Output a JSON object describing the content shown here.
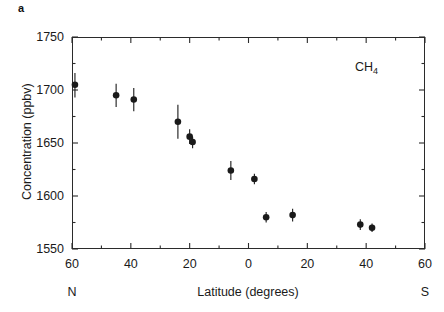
{
  "figure": {
    "panel_label": "a"
  },
  "chart_data": {
    "type": "scatter",
    "title": "",
    "annotation": "CH4",
    "annotation_display": "CH",
    "annotation_subscript": "4",
    "xlabel": "Latitude (degrees)",
    "ylabel": "Concentration (ppbv)",
    "x_left_hemisphere": "N",
    "x_right_hemisphere": "S",
    "xlim": [
      -60,
      60
    ],
    "ylim": [
      1550,
      1750
    ],
    "x_axis_note": "negative values are degrees North, positive values are degrees South",
    "xticks": [
      -60,
      -40,
      -20,
      0,
      20,
      40,
      60
    ],
    "xtick_labels": [
      "60",
      "40",
      "20",
      "0",
      "20",
      "40",
      "60"
    ],
    "x_minor_ticks": [
      -50,
      -30,
      -10,
      10,
      30,
      50
    ],
    "yticks": [
      1550,
      1600,
      1650,
      1700,
      1750
    ],
    "ytick_labels": [
      "1550",
      "1600",
      "1650",
      "1700",
      "1750"
    ],
    "y_minor_ticks": [
      1575,
      1625,
      1675,
      1725
    ],
    "grid": false,
    "legend": "none",
    "error_bars": "vertical",
    "marker": "filled-circle",
    "marker_color": "#1a1a1a",
    "points": [
      {
        "latitude": -59,
        "value": 1705,
        "err_low": 12,
        "err_high": 11
      },
      {
        "latitude": -45,
        "value": 1695,
        "err_low": 11,
        "err_high": 11
      },
      {
        "latitude": -39,
        "value": 1691,
        "err_low": 11,
        "err_high": 11
      },
      {
        "latitude": -24,
        "value": 1670,
        "err_low": 16,
        "err_high": 16
      },
      {
        "latitude": -20,
        "value": 1656,
        "err_low": 7,
        "err_high": 7
      },
      {
        "latitude": -19,
        "value": 1651,
        "err_low": 6,
        "err_high": 5
      },
      {
        "latitude": -6,
        "value": 1624,
        "err_low": 9,
        "err_high": 9
      },
      {
        "latitude": 2,
        "value": 1616,
        "err_low": 5,
        "err_high": 5
      },
      {
        "latitude": 6,
        "value": 1580,
        "err_low": 5,
        "err_high": 5
      },
      {
        "latitude": 15,
        "value": 1582,
        "err_low": 6,
        "err_high": 6
      },
      {
        "latitude": 38,
        "value": 1573,
        "err_low": 5,
        "err_high": 5
      },
      {
        "latitude": 42,
        "value": 1570,
        "err_low": 4,
        "err_high": 4
      }
    ]
  }
}
